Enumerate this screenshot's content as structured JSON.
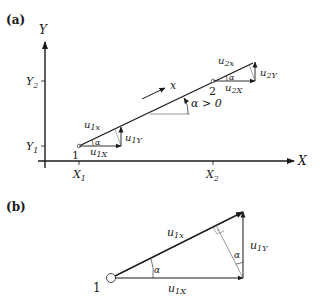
{
  "panels": {
    "a": {
      "label": "(a)",
      "axes": {
        "x_label": "X",
        "y_label": "Y",
        "x_ticks": [
          {
            "main": "X",
            "sub": "1"
          },
          {
            "main": "X",
            "sub": "2"
          }
        ],
        "y_ticks": [
          {
            "main": "Y",
            "sub": "1"
          },
          {
            "main": "Y",
            "sub": "2"
          }
        ]
      },
      "points": [
        {
          "label": "1"
        },
        {
          "label": "2"
        }
      ],
      "direction_label": "x",
      "angle_label": "α > 0",
      "vectors_1": {
        "along": {
          "main": "u",
          "sub": "1x"
        },
        "X": {
          "main": "u",
          "sub": "1X"
        },
        "Y": {
          "main": "u",
          "sub": "1Y"
        },
        "angle": "α"
      },
      "vectors_2": {
        "along": {
          "main": "u",
          "sub": "2x"
        },
        "X": {
          "main": "u",
          "sub": "2X"
        },
        "Y": {
          "main": "u",
          "sub": "2Y"
        },
        "angle": "α"
      }
    },
    "b": {
      "label": "(b)",
      "point_label": "1",
      "hyp": {
        "main": "u",
        "sub": "1x"
      },
      "base": {
        "main": "u",
        "sub": "1X"
      },
      "vert": {
        "main": "u",
        "sub": "1Y"
      },
      "angle_base": "α",
      "angle_top": "α"
    }
  },
  "colors": {
    "stroke": "#1a1a1a",
    "thin": "#555555"
  }
}
